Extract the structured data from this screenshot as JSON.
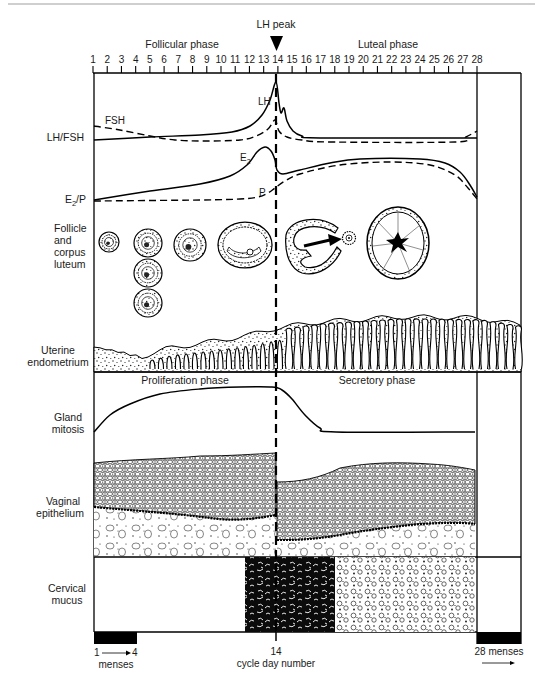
{
  "header": {
    "lh_peak": "LH peak",
    "follicular_phase": "Follicular phase",
    "luteal_phase": "Luteal phase"
  },
  "axis": {
    "days": [
      "1",
      "2",
      "3",
      "4",
      "5",
      "6",
      "7",
      "8",
      "9",
      "10",
      "11",
      "12",
      "13",
      "14",
      "15",
      "16",
      "17",
      "18",
      "19",
      "20",
      "21",
      "22",
      "23",
      "24",
      "25",
      "26",
      "27",
      "28"
    ],
    "x_day1": 93,
    "x_day28": 477
  },
  "rows": {
    "lh_fsh": "LH/FSH",
    "e2p": {
      "e": "E",
      "sub": "2",
      "rest": "/P"
    },
    "follicle": [
      "Follicle",
      "and",
      "corpus",
      "luteum"
    ],
    "endometrium": [
      "Uterine",
      "endometrium"
    ],
    "gland": [
      "Gland",
      "mitosis"
    ],
    "vaginal": [
      "Vaginal",
      "epithelium"
    ],
    "cervical": [
      "Cervical",
      "mucus"
    ]
  },
  "curve_labels": {
    "lh": "LH",
    "fsh": "FSH",
    "e2": "E",
    "e2_sub": "2",
    "p": "P"
  },
  "endometrium_phases": {
    "proliferation": "Proliferation phase",
    "secretory": "Secretory phase"
  },
  "footer": {
    "menses_from": "1",
    "menses_arrow": "→",
    "menses_to": "4",
    "menses": "menses",
    "peak_day": "14",
    "cycle_day_number": "cycle day number",
    "menses_28": "28 menses"
  },
  "plot_paths": {
    "lh": [
      [
        94,
        140
      ],
      [
        150,
        137
      ],
      [
        200,
        135
      ],
      [
        232,
        132
      ],
      [
        250,
        126
      ],
      [
        262,
        115
      ],
      [
        270,
        100
      ],
      [
        276,
        82
      ],
      [
        279,
        103
      ],
      [
        281,
        113
      ],
      [
        284,
        108
      ],
      [
        287,
        121
      ],
      [
        293,
        131
      ],
      [
        302,
        136
      ],
      [
        320,
        138
      ],
      [
        477,
        138
      ]
    ],
    "fsh": [
      [
        94,
        126
      ],
      [
        120,
        130
      ],
      [
        150,
        136
      ],
      [
        175,
        140
      ],
      [
        205,
        141
      ],
      [
        240,
        140
      ],
      [
        256,
        136
      ],
      [
        268,
        129
      ],
      [
        275,
        120
      ],
      [
        279,
        131
      ],
      [
        287,
        137
      ],
      [
        302,
        140
      ],
      [
        330,
        142
      ],
      [
        455,
        142
      ],
      [
        466,
        137
      ],
      [
        477,
        131
      ]
    ],
    "e2": [
      [
        94,
        200
      ],
      [
        150,
        191
      ],
      [
        200,
        184
      ],
      [
        230,
        176
      ],
      [
        247,
        165
      ],
      [
        257,
        152
      ],
      [
        265,
        147
      ],
      [
        271,
        151
      ],
      [
        275,
        160
      ],
      [
        277,
        170
      ],
      [
        283,
        174
      ],
      [
        300,
        170
      ],
      [
        330,
        163
      ],
      [
        360,
        159
      ],
      [
        420,
        159
      ],
      [
        445,
        163
      ],
      [
        460,
        172
      ],
      [
        470,
        185
      ],
      [
        477,
        197
      ]
    ],
    "p": [
      [
        94,
        201
      ],
      [
        200,
        200
      ],
      [
        240,
        199
      ],
      [
        258,
        197
      ],
      [
        268,
        193
      ],
      [
        275,
        188
      ],
      [
        285,
        181
      ],
      [
        300,
        174
      ],
      [
        340,
        165
      ],
      [
        390,
        162
      ],
      [
        430,
        165
      ],
      [
        455,
        175
      ],
      [
        468,
        188
      ],
      [
        477,
        199
      ]
    ],
    "gland": [
      [
        94,
        432
      ],
      [
        110,
        415
      ],
      [
        130,
        404
      ],
      [
        160,
        394
      ],
      [
        200,
        389
      ],
      [
        240,
        387
      ],
      [
        272,
        387
      ],
      [
        282,
        390
      ],
      [
        292,
        399
      ],
      [
        305,
        415
      ],
      [
        320,
        428
      ],
      [
        336,
        432
      ],
      [
        475,
        432
      ]
    ],
    "endometrium_top": [
      [
        94,
        347
      ],
      [
        120,
        352
      ],
      [
        140,
        357
      ],
      [
        170,
        348
      ],
      [
        210,
        342
      ],
      [
        250,
        335
      ],
      [
        276,
        328
      ],
      [
        320,
        322
      ],
      [
        400,
        317
      ],
      [
        477,
        318
      ],
      [
        521,
        325
      ]
    ]
  },
  "chart_data": {
    "type": "line",
    "xlabel": "cycle day number",
    "ylabel": "",
    "x": [
      1,
      2,
      3,
      4,
      5,
      6,
      7,
      8,
      9,
      10,
      11,
      12,
      13,
      14,
      15,
      16,
      17,
      18,
      19,
      20,
      21,
      22,
      23,
      24,
      25,
      26,
      27,
      28
    ],
    "annotations": [
      "LH peak (day 14)",
      "Follicular phase (days 1-14)",
      "Luteal phase (days 14-28)",
      "Proliferation phase",
      "Secretory phase",
      "menses days 1-4",
      "28 menses"
    ],
    "grid": false,
    "series": [
      {
        "name": "LH",
        "panel": "LH/FSH",
        "style": "solid",
        "values": [
          10,
          10,
          11,
          11,
          11,
          12,
          12,
          12,
          13,
          13,
          14,
          16,
          35,
          100,
          45,
          10,
          9,
          9,
          9,
          9,
          9,
          9,
          9,
          9,
          9,
          9,
          9,
          9
        ]
      },
      {
        "name": "FSH",
        "panel": "LH/FSH",
        "style": "dashed",
        "values": [
          25,
          22,
          19,
          16,
          12,
          9,
          8,
          8,
          8,
          8,
          8,
          10,
          18,
          35,
          12,
          7,
          6,
          6,
          6,
          6,
          6,
          6,
          6,
          6,
          6,
          7,
          10,
          18
        ]
      },
      {
        "name": "E2",
        "panel": "E2/P",
        "style": "solid",
        "values": [
          5,
          7,
          9,
          11,
          13,
          15,
          17,
          19,
          22,
          25,
          30,
          45,
          95,
          55,
          52,
          58,
          65,
          70,
          74,
          76,
          77,
          77,
          77,
          76,
          73,
          66,
          45,
          8
        ]
      },
      {
        "name": "P",
        "panel": "E2/P",
        "style": "dashed",
        "values": [
          3,
          3,
          3,
          3,
          3,
          3,
          3,
          3,
          3,
          3,
          4,
          5,
          8,
          20,
          35,
          48,
          58,
          65,
          69,
          71,
          71,
          70,
          70,
          68,
          64,
          55,
          35,
          5
        ]
      },
      {
        "name": "Gland mitosis",
        "panel": "Gland mitosis",
        "style": "solid",
        "values": [
          0,
          35,
          55,
          68,
          78,
          85,
          90,
          94,
          97,
          98,
          99,
          100,
          100,
          100,
          85,
          40,
          5,
          0,
          0,
          0,
          0,
          0,
          0,
          0,
          0,
          0,
          0,
          0
        ]
      }
    ]
  }
}
